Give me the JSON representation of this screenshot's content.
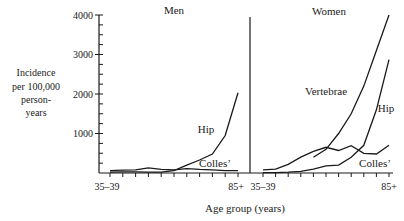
{
  "chart_data": {
    "type": "line",
    "title": "",
    "xlabel": "Age group (years)",
    "ylabel": [
      "Incidence",
      "per 100,000",
      "person-",
      "years"
    ],
    "ylim": [
      0,
      4000
    ],
    "yticks": [
      1000,
      2000,
      3000,
      4000
    ],
    "ytick_labels": [
      "1000",
      "2000",
      "3000",
      "4000"
    ],
    "y_minor_step": 250,
    "grid": false,
    "x": [
      "35-39",
      "40-44",
      "45-49",
      "50-54",
      "55-59",
      "60-64",
      "65-69",
      "70-74",
      "75-79",
      "80-84",
      "85+"
    ],
    "xtick_labels_shown": [
      "35–39",
      "85+"
    ],
    "panels": [
      {
        "name": "Men",
        "series": [
          {
            "name": "Hip",
            "label": "Hip",
            "values": [
              20,
              30,
              30,
              20,
              20,
              60,
              200,
              330,
              480,
              950,
              2030
            ]
          },
          {
            "name": "Colles'",
            "label": "Colles’",
            "values": [
              60,
              70,
              80,
              130,
              90,
              80,
              110,
              90,
              80,
              60,
              60
            ]
          }
        ]
      },
      {
        "name": "Women",
        "series": [
          {
            "name": "Vertebrae",
            "label": "Vertebrae",
            "values": [
              null,
              null,
              null,
              null,
              400,
              600,
              1000,
              1500,
              2200,
              3100,
              4000
            ]
          },
          {
            "name": "Hip",
            "label": "Hip",
            "values": [
              10,
              10,
              20,
              40,
              100,
              180,
              200,
              400,
              700,
              1600,
              2870
            ]
          },
          {
            "name": "Colles'",
            "label": "Colles’",
            "values": [
              80,
              100,
              220,
              400,
              550,
              650,
              570,
              690,
              500,
              480,
              700
            ]
          }
        ]
      }
    ]
  }
}
